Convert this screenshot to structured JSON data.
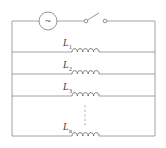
{
  "diagram": {
    "type": "parallel inductor circuit",
    "source": {
      "symbol": "~",
      "kind": "AC source"
    },
    "switch": {
      "state": "open"
    },
    "inductors": [
      {
        "label": "L",
        "subscript": "1"
      },
      {
        "label": "L",
        "subscript": "2"
      },
      {
        "label": "L",
        "subscript": "3"
      },
      {
        "label": "L",
        "subscript": "n"
      }
    ],
    "ellipsis": "dashed continuation",
    "colors": {
      "wire": "#8a8a8a",
      "coil": "#6a6a6a"
    }
  }
}
